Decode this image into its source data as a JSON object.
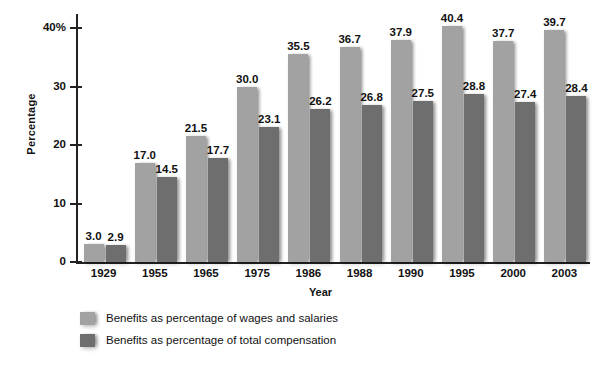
{
  "chart_data": {
    "type": "bar",
    "title": "",
    "xlabel": "Year",
    "ylabel": "Percentage",
    "categories": [
      "1929",
      "1955",
      "1965",
      "1975",
      "1986",
      "1988",
      "1990",
      "1995",
      "2000",
      "2003"
    ],
    "series": [
      {
        "name": "Benefits as percentage of wages and salaries",
        "color": "#a2a2a2",
        "values": [
          3.0,
          17.0,
          21.5,
          30.0,
          35.5,
          36.7,
          37.9,
          40.4,
          37.7,
          39.7
        ],
        "labels": [
          "3.0",
          "17.0",
          "21.5",
          "30.0",
          "35.5",
          "36.7",
          "37.9",
          "40.4",
          "37.7",
          "39.7"
        ]
      },
      {
        "name": "Benefits as percentage of total compensation",
        "color": "#6e6e6e",
        "values": [
          2.9,
          14.5,
          17.7,
          23.1,
          26.2,
          26.8,
          27.5,
          28.8,
          27.4,
          28.4
        ],
        "labels": [
          "2.9",
          "14.5",
          "17.7",
          "23.1",
          "26.2",
          "26.8",
          "27.5",
          "28.8",
          "27.4",
          "28.4"
        ]
      }
    ],
    "ylim": [
      0,
      42.5
    ],
    "yticks": [
      0,
      10,
      20,
      30,
      40
    ],
    "ytick_labels": [
      "0",
      "10",
      "20",
      "30",
      "40%"
    ],
    "grid": false,
    "legend_position": "bottom-left"
  }
}
